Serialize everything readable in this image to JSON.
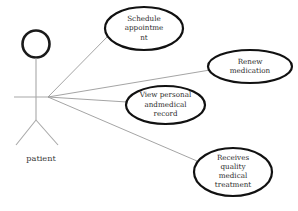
{
  "diagram": {
    "type": "uml-use-case-diagram",
    "background_color": "#ffffff",
    "line_color": "#9a9a9a",
    "ellipse_stroke_color": "#111111",
    "text_color": "#2b2b2b",
    "width": 298,
    "height": 211
  },
  "actor": {
    "label": "patient",
    "head_center_x": 36,
    "head_center_y": 44,
    "head_radius": 13.5,
    "body_top_y": 58,
    "body_bottom_y": 120,
    "arms_y": 97,
    "arm_left_x": 14,
    "arm_right_x": 48,
    "leg_left_x": 16,
    "leg_right_x": 58,
    "leg_bottom_y": 145,
    "label_x": 41,
    "label_y": 161
  },
  "connection_hub": {
    "x": 48,
    "y": 97
  },
  "use_cases": [
    {
      "id": "schedule-appointment",
      "lines": [
        "Schedule",
        "appointme",
        "nt"
      ],
      "cx": 144,
      "cy": 28.5,
      "rx": 39,
      "ry": 21.5,
      "line_height": 9.5,
      "connector_x": 108,
      "connector_y": 36
    },
    {
      "id": "renew-medication",
      "lines": [
        "Renew",
        "medication"
      ],
      "cx": 250,
      "cy": 66.5,
      "rx": 42,
      "ry": 16.5,
      "line_height": 9.5,
      "connector_x": 210,
      "connector_y": 70
    },
    {
      "id": "view-personal-and-medical-record",
      "lines": [
        "View personal",
        "andmedical",
        "record"
      ],
      "cx": 165.5,
      "cy": 105,
      "rx": 39.5,
      "ry": 19,
      "line_height": 9.5,
      "connector_x": 127,
      "connector_y": 102
    },
    {
      "id": "receives-quality-medical-treatment",
      "lines": [
        "Receives",
        "quality",
        "medical",
        "treatment"
      ],
      "cx": 233,
      "cy": 172,
      "rx": 39,
      "ry": 24,
      "line_height": 9.2,
      "connector_x": 197,
      "connector_y": 161
    }
  ]
}
